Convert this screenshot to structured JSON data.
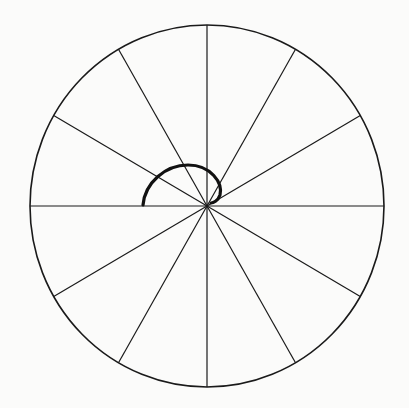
{
  "diagram": {
    "center": [
      207,
      206
    ],
    "radius_x": 177,
    "radius_y": 181,
    "spoke_count": 12,
    "spoke_angle_step_deg": 30,
    "colors": {
      "background": "#fbfbfa",
      "stroke": "#1a1a1a",
      "arc": "#111111"
    },
    "arc": {
      "start": [
        143,
        205
      ],
      "end": [
        211,
        203
      ],
      "stroke_width": 3.2
    }
  }
}
